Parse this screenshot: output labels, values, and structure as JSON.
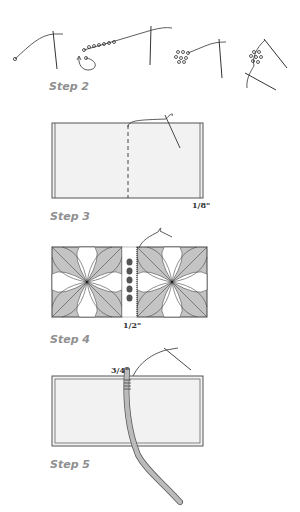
{
  "steps": [
    {
      "id": "step2",
      "label": "Step 2",
      "description": "Needle and thread sequence stringing beads, forming a circle of beads"
    },
    {
      "id": "step3",
      "label": "Step 3",
      "description": "Panel with dashed center fold line and stitch at top",
      "measurement": "1/8\""
    },
    {
      "id": "step4",
      "label": "Step 4",
      "description": "Two patterned squares joined with beaded strip between",
      "measurement": "1/2\""
    },
    {
      "id": "step5",
      "label": "Step 5",
      "description": "Panel with cord inserted and stitched at top",
      "measurement": "3/4\""
    }
  ],
  "colors": {
    "line": "#333333",
    "panel_fill": "#f2f2f2",
    "pattern_fill": "#c4c4c4",
    "label": "#8f8f8f",
    "cord": "#b8b8b8"
  }
}
